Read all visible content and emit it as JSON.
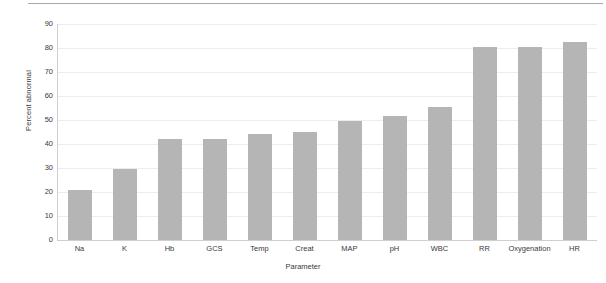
{
  "chart_data": {
    "type": "bar",
    "title": "",
    "subtitle": "",
    "xlabel": "Parameter",
    "ylabel": "Percent abnormal",
    "categories": [
      "Na",
      "K",
      "Hb",
      "GCS",
      "Temp",
      "Creat",
      "MAP",
      "pH",
      "WBC",
      "RR",
      "Oxygenation",
      "HR"
    ],
    "values": [
      21,
      29.5,
      42,
      42,
      44,
      45,
      49.5,
      51.5,
      55.5,
      80.5,
      80.5,
      82.5
    ],
    "series": [
      {
        "name": "Percent abnormal",
        "values": [
          21,
          29.5,
          42,
          42,
          44,
          45,
          49.5,
          51.5,
          55.5,
          80.5,
          80.5,
          82.5
        ]
      }
    ],
    "ylim": [
      0,
      90
    ],
    "ytick_values": [
      0,
      10,
      20,
      30,
      40,
      50,
      60,
      70,
      80,
      90
    ],
    "ytick_labels": [
      "0",
      "10",
      "20",
      "30",
      "40",
      "50",
      "60",
      "70",
      "80",
      "90"
    ],
    "grid": true,
    "grid_axis": "y",
    "legend": false,
    "legend_position": "none",
    "bar_color": "#b5b5b5",
    "grid_color": "#ededed",
    "axis_color": "#cfcfcf",
    "text_color": "#3a3a3a",
    "background_color": "#ffffff",
    "annotations": []
  }
}
